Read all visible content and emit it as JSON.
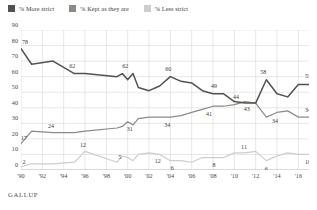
{
  "legend": {
    "position": "top-left",
    "items": [
      {
        "label": "% More strict",
        "color": "#55514e",
        "key": "more"
      },
      {
        "label": "% Kept as they are",
        "color": "#8d8a86",
        "key": "kept"
      },
      {
        "label": "% Less strict",
        "color": "#cfcdc9",
        "key": "less"
      }
    ]
  },
  "source": {
    "label": "GALLUP"
  },
  "chart_data": {
    "type": "line",
    "title": "",
    "subtitle": "",
    "xlabel": "",
    "ylabel": "",
    "ylim": [
      0,
      90
    ],
    "yticks": [
      0,
      10,
      20,
      30,
      40,
      50,
      60,
      70,
      80,
      90
    ],
    "ytick_labels": [
      "0",
      "10",
      "20",
      "30",
      "40",
      "50",
      "60",
      "70",
      "80",
      "90"
    ],
    "grid": true,
    "legend_position": "top-left",
    "xlim": [
      1990,
      2017
    ],
    "xticks": [
      1990,
      1992,
      1994,
      1996,
      1998,
      2000,
      2002,
      2004,
      2006,
      2008,
      2010,
      2012,
      2014,
      2016
    ],
    "xtick_labels": [
      "'90",
      "'92",
      "'94",
      "'96",
      "'98",
      "'00",
      "'02",
      "'04",
      "'06",
      "'08",
      "'10",
      "'12",
      "'14",
      "'16"
    ],
    "x": [
      1990,
      1991,
      1993,
      1995,
      1996,
      1999,
      1999.5,
      2000,
      2000.5,
      2001,
      2002,
      2003,
      2004,
      2005,
      2006,
      2007,
      2008,
      2009,
      2010,
      2011,
      2012,
      2013,
      2014,
      2015,
      2016,
      2017
    ],
    "series": [
      {
        "name": "% More strict",
        "color": "#55514e",
        "values": [
          78,
          68,
          70,
          62,
          62,
          60,
          62,
          58,
          62,
          53,
          51,
          54,
          60,
          57,
          56,
          51,
          49,
          49,
          44,
          43,
          43,
          58,
          49,
          47,
          55,
          55
        ]
      },
      {
        "name": "% Kept as they are",
        "color": "#8d8a86",
        "values": [
          17,
          25,
          24,
          24,
          25,
          27,
          28,
          31,
          29,
          33,
          34,
          34,
          34,
          35,
          37,
          39,
          41,
          41,
          42,
          44,
          43,
          34,
          37,
          38,
          34,
          34
        ]
      },
      {
        "name": "% Less strict",
        "color": "#cfcdc9",
        "values": [
          2,
          4,
          4,
          5,
          12,
          5,
          9,
          8,
          6,
          10,
          11,
          10,
          6,
          6,
          5,
          8,
          8,
          8,
          11,
          11,
          12,
          6,
          9,
          11,
          10,
          10
        ]
      }
    ],
    "annotations": [
      {
        "series": "% More strict",
        "year": 1990,
        "value": 78,
        "text": "78",
        "dx": 4,
        "dy": -5
      },
      {
        "series": "% More strict",
        "year": 1995,
        "value": 62,
        "text": "62",
        "dx": -2,
        "dy": -6
      },
      {
        "series": "% More strict",
        "year": 1999.5,
        "value": 62,
        "text": "62",
        "dx": 3,
        "dy": -6
      },
      {
        "series": "% More strict",
        "year": 2004,
        "value": 60,
        "text": "60",
        "dx": -2,
        "dy": -6
      },
      {
        "series": "% More strict",
        "year": 2008,
        "value": 49,
        "text": "49",
        "dx": 1,
        "dy": -6
      },
      {
        "series": "% More strict",
        "year": 2011,
        "value": 43,
        "text": "44",
        "dx": -9,
        "dy": -4
      },
      {
        "series": "% More strict",
        "year": 2013,
        "value": 58,
        "text": "58",
        "dx": -3,
        "dy": -6
      },
      {
        "series": "% More strict",
        "year": 2017,
        "value": 55,
        "text": "55",
        "dx": -1,
        "dy": -6
      },
      {
        "series": "% Kept as they are",
        "year": 1990,
        "value": 17,
        "text": "17",
        "dx": 3,
        "dy": -4
      },
      {
        "series": "% Kept as they are",
        "year": 1993,
        "value": 24,
        "text": "24",
        "dx": -2,
        "dy": -5
      },
      {
        "series": "% Kept as they are",
        "year": 2000,
        "value": 31,
        "text": "31",
        "dx": 2,
        "dy": 9
      },
      {
        "series": "% Kept as they are",
        "year": 2004,
        "value": 34,
        "text": "34",
        "dx": -3,
        "dy": 10
      },
      {
        "series": "% Kept as they are",
        "year": 2008,
        "value": 41,
        "text": "41",
        "dx": -4,
        "dy": 10
      },
      {
        "series": "% Kept as they are",
        "year": 2012,
        "value": 43,
        "text": "43",
        "dx": -9,
        "dy": 8
      },
      {
        "series": "% Kept as they are",
        "year": 2014,
        "value": 37,
        "text": "34",
        "dx": -2,
        "dy": 11
      },
      {
        "series": "% Kept as they are",
        "year": 2017,
        "value": 34,
        "text": "34",
        "dx": -1,
        "dy": -5
      },
      {
        "series": "% Less strict",
        "year": 1990,
        "value": 2,
        "text": "2",
        "dx": 3,
        "dy": -3
      },
      {
        "series": "% Less strict",
        "year": 1996,
        "value": 12,
        "text": "12",
        "dx": -2,
        "dy": -4
      },
      {
        "series": "% Less strict",
        "year": 1999,
        "value": 5,
        "text": "5",
        "dx": 3,
        "dy": -3
      },
      {
        "series": "% Less strict",
        "year": 2003,
        "value": 10,
        "text": "12",
        "dx": -2,
        "dy": 9
      },
      {
        "series": "% Less strict",
        "year": 2004,
        "value": 6,
        "text": "6",
        "dx": 2,
        "dy": 9
      },
      {
        "series": "% Less strict",
        "year": 2008,
        "value": 8,
        "text": "8",
        "dx": 1,
        "dy": 9
      },
      {
        "series": "% Less strict",
        "year": 2011,
        "value": 11,
        "text": "11",
        "dx": -1,
        "dy": -4
      },
      {
        "series": "% Less strict",
        "year": 2013,
        "value": 6,
        "text": "6",
        "dx": 0,
        "dy": 10
      },
      {
        "series": "% Less strict",
        "year": 2017,
        "value": 10,
        "text": "10",
        "dx": -1,
        "dy": 10
      }
    ]
  }
}
